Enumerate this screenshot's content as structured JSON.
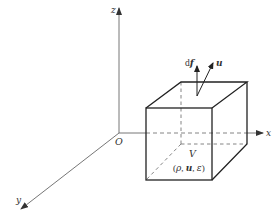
{
  "diagram": {
    "type": "control-volume-3d",
    "axes": {
      "x_label": "x",
      "y_label": "y",
      "z_label": "z",
      "origin_label": "O"
    },
    "volume": {
      "name_label": "V",
      "state_label_open": "(",
      "state_rho": "ρ",
      "state_sep1": ", ",
      "state_u": "u",
      "state_sep2": ", ",
      "state_eps": "ε",
      "state_label_close": ")"
    },
    "vectors": {
      "surface_force_prefix": "d",
      "surface_force_symbol": "f",
      "velocity_symbol": "u"
    },
    "colors": {
      "axis": "#555555",
      "cube_edge": "#222222",
      "hidden_edge": "#777777",
      "text": "#333333"
    }
  }
}
